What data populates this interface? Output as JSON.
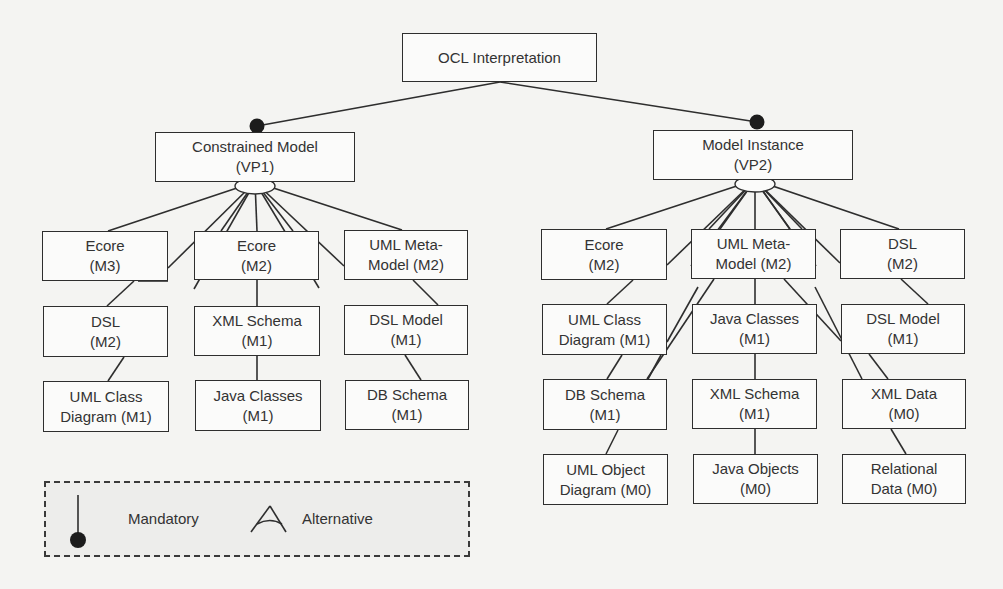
{
  "diagram": {
    "root": {
      "id": "ocl",
      "lines": [
        "OCL Interpretation"
      ],
      "box": [
        402,
        33,
        195,
        49
      ]
    },
    "variation_points": [
      {
        "id": "vp1",
        "lines": [
          "Constrained Model",
          "(VP1)"
        ],
        "box": [
          155,
          132,
          200,
          50
        ],
        "relation": "mandatory",
        "dot": [
          257,
          126
        ]
      },
      {
        "id": "vp2",
        "lines": [
          "Model Instance",
          "(VP2)"
        ],
        "box": [
          653,
          130,
          200,
          50
        ],
        "relation": "mandatory",
        "dot": [
          757,
          122
        ]
      }
    ],
    "left_nodes": [
      {
        "id": "l_ecore_m3",
        "lines": [
          "Ecore",
          "(M3)"
        ],
        "box": [
          42,
          231,
          126,
          50
        ]
      },
      {
        "id": "l_ecore_m2",
        "lines": [
          "Ecore",
          "(M2)"
        ],
        "box": [
          194,
          231,
          125,
          49
        ]
      },
      {
        "id": "l_uml_meta",
        "lines": [
          "UML Meta-",
          "Model (M2)"
        ],
        "box": [
          344,
          230,
          124,
          50
        ]
      },
      {
        "id": "l_dsl_m2",
        "lines": [
          "DSL",
          "(M2)"
        ],
        "box": [
          43,
          306,
          125,
          51
        ]
      },
      {
        "id": "l_xml_schema",
        "lines": [
          "XML Schema",
          "(M1)"
        ],
        "box": [
          194,
          306,
          126,
          50
        ]
      },
      {
        "id": "l_dsl_model",
        "lines": [
          "DSL Model",
          "(M1)"
        ],
        "box": [
          344,
          305,
          124,
          50
        ]
      },
      {
        "id": "l_uml_class",
        "lines": [
          "UML Class",
          "Diagram (M1)"
        ],
        "box": [
          43,
          381,
          126,
          51
        ]
      },
      {
        "id": "l_java_classes",
        "lines": [
          "Java Classes",
          "(M1)"
        ],
        "box": [
          195,
          380,
          126,
          51
        ]
      },
      {
        "id": "l_db_schema",
        "lines": [
          "DB Schema",
          "(M1)"
        ],
        "box": [
          345,
          380,
          124,
          50
        ]
      }
    ],
    "right_nodes": [
      {
        "id": "r_ecore_m2",
        "lines": [
          "Ecore",
          "(M2)"
        ],
        "box": [
          541,
          229,
          126,
          51
        ]
      },
      {
        "id": "r_uml_meta",
        "lines": [
          "UML Meta-",
          "Model (M2)"
        ],
        "box": [
          691,
          229,
          125,
          50
        ]
      },
      {
        "id": "r_dsl_m2",
        "lines": [
          "DSL",
          "(M2)"
        ],
        "box": [
          840,
          229,
          125,
          50
        ]
      },
      {
        "id": "r_uml_class",
        "lines": [
          "UML Class",
          "Diagram (M1)"
        ],
        "box": [
          542,
          304,
          125,
          51
        ]
      },
      {
        "id": "r_java_classes",
        "lines": [
          "Java Classes",
          "(M1)"
        ],
        "box": [
          692,
          304,
          125,
          50
        ]
      },
      {
        "id": "r_dsl_model",
        "lines": [
          "DSL Model",
          "(M1)"
        ],
        "box": [
          841,
          304,
          124,
          50
        ]
      },
      {
        "id": "r_db_schema",
        "lines": [
          "DB Schema",
          "(M1)"
        ],
        "box": [
          543,
          379,
          124,
          51
        ]
      },
      {
        "id": "r_xml_schema",
        "lines": [
          "XML Schema",
          "(M1)"
        ],
        "box": [
          692,
          379,
          125,
          50
        ]
      },
      {
        "id": "r_xml_data",
        "lines": [
          "XML Data",
          "(M0)"
        ],
        "box": [
          842,
          379,
          124,
          50
        ]
      },
      {
        "id": "r_uml_object",
        "lines": [
          "UML Object",
          "Diagram (M0)"
        ],
        "box": [
          543,
          454,
          125,
          51
        ]
      },
      {
        "id": "r_java_objects",
        "lines": [
          "Java Objects",
          "(M0)"
        ],
        "box": [
          693,
          454,
          125,
          50
        ]
      },
      {
        "id": "r_relational",
        "lines": [
          "Relational",
          "Data (M0)"
        ],
        "box": [
          842,
          454,
          124,
          50
        ]
      }
    ],
    "edges": [
      [
        [
          500,
          82
        ],
        [
          257,
          126
        ]
      ],
      [
        [
          500,
          82
        ],
        [
          757,
          122
        ]
      ],
      [
        [
          255,
          182
        ],
        [
          108,
          231
        ]
      ],
      [
        [
          255,
          182
        ],
        [
          168,
          268
        ]
      ],
      [
        [
          255,
          182
        ],
        [
          221,
          231
        ]
      ],
      [
        [
          255,
          182
        ],
        [
          194,
          289
        ]
      ],
      [
        [
          255,
          182
        ],
        [
          257,
          231
        ]
      ],
      [
        [
          255,
          182
        ],
        [
          293,
          231
        ]
      ],
      [
        [
          255,
          182
        ],
        [
          319,
          288
        ]
      ],
      [
        [
          255,
          182
        ],
        [
          344,
          266
        ]
      ],
      [
        [
          255,
          182
        ],
        [
          402,
          230
        ]
      ],
      [
        [
          168,
          281
        ],
        [
          138,
          281
        ]
      ],
      [
        [
          134,
          281
        ],
        [
          107,
          306
        ]
      ],
      [
        [
          413,
          280
        ],
        [
          438,
          305
        ]
      ],
      [
        [
          257,
          280
        ],
        [
          257,
          306
        ]
      ],
      [
        [
          257,
          356
        ],
        [
          257,
          380
        ]
      ],
      [
        [
          124,
          357
        ],
        [
          108,
          381
        ]
      ],
      [
        [
          405,
          355
        ],
        [
          421,
          380
        ]
      ],
      [
        [
          755,
          180
        ],
        [
          606,
          229
        ]
      ],
      [
        [
          755,
          180
        ],
        [
          667,
          265
        ]
      ],
      [
        [
          755,
          180
        ],
        [
          709,
          229
        ]
      ],
      [
        [
          755,
          180
        ],
        [
          691,
          266
        ]
      ],
      [
        [
          755,
          180
        ],
        [
          720,
          229
        ]
      ],
      [
        [
          755,
          180
        ],
        [
          755,
          229
        ]
      ],
      [
        [
          755,
          180
        ],
        [
          790,
          229
        ]
      ],
      [
        [
          755,
          180
        ],
        [
          802,
          229
        ]
      ],
      [
        [
          755,
          180
        ],
        [
          816,
          266
        ]
      ],
      [
        [
          755,
          180
        ],
        [
          840,
          263
        ]
      ],
      [
        [
          755,
          180
        ],
        [
          899,
          229
        ]
      ],
      [
        [
          633,
          280
        ],
        [
          607,
          304
        ]
      ],
      [
        [
          698,
          287
        ],
        [
          667,
          342
        ]
      ],
      [
        [
          714,
          279
        ],
        [
          647,
          379
        ]
      ],
      [
        [
          784,
          279
        ],
        [
          841,
          341
        ]
      ],
      [
        [
          815,
          287
        ],
        [
          862,
          379
        ]
      ],
      [
        [
          901,
          279
        ],
        [
          928,
          304
        ]
      ],
      [
        [
          755,
          279
        ],
        [
          755,
          304
        ]
      ],
      [
        [
          755,
          354
        ],
        [
          755,
          379
        ]
      ],
      [
        [
          622,
          355
        ],
        [
          607,
          379
        ]
      ],
      [
        [
          661,
          355
        ],
        [
          648,
          379
        ]
      ],
      [
        [
          869,
          354
        ],
        [
          888,
          379
        ]
      ],
      [
        [
          618,
          430
        ],
        [
          606,
          454
        ]
      ],
      [
        [
          755,
          429
        ],
        [
          755,
          454
        ]
      ],
      [
        [
          891,
          429
        ],
        [
          906,
          454
        ]
      ]
    ],
    "alt_arcs": [
      {
        "id": "vp1-alt",
        "cx": 255,
        "cy": 182,
        "rx": 20,
        "ry": 8
      },
      {
        "id": "vp2-alt",
        "cx": 755,
        "cy": 180,
        "rx": 20,
        "ry": 8
      }
    ]
  },
  "legend": {
    "mandatory_label": "Mandatory",
    "alternative_label": "Alternative"
  },
  "colors": {
    "line": "#2e2e2e",
    "box_bg": "#fbfbfa",
    "background": "#f4f4f2",
    "legend_bg": "#ededeb"
  }
}
